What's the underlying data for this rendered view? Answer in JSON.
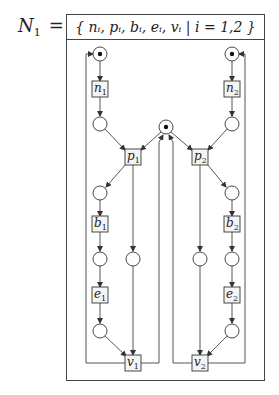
{
  "net": {
    "name": "N",
    "subscript": "1",
    "equals": "=",
    "set_definition": "{ nᵢ, pᵢ, bᵢ, eᵢ, vᵢ  |  i = 1,2 }"
  },
  "transitions": [
    {
      "id": "n1",
      "letter": "n",
      "sub": "1",
      "x": 100,
      "y": 89
    },
    {
      "id": "n2",
      "letter": "n",
      "sub": "2",
      "x": 232,
      "y": 89
    },
    {
      "id": "p1",
      "letter": "p",
      "sub": "1",
      "x": 133,
      "y": 157
    },
    {
      "id": "p2",
      "letter": "p",
      "sub": "2",
      "x": 200,
      "y": 157
    },
    {
      "id": "b1",
      "letter": "b",
      "sub": "1",
      "x": 100,
      "y": 224
    },
    {
      "id": "b2",
      "letter": "b",
      "sub": "2",
      "x": 232,
      "y": 224
    },
    {
      "id": "e1",
      "letter": "e",
      "sub": "1",
      "x": 100,
      "y": 295
    },
    {
      "id": "e2",
      "letter": "e",
      "sub": "2",
      "x": 232,
      "y": 295
    },
    {
      "id": "v1",
      "letter": "v",
      "sub": "1",
      "x": 133,
      "y": 363
    },
    {
      "id": "v2",
      "letter": "v",
      "sub": "2",
      "x": 200,
      "y": 363
    }
  ],
  "places": [
    {
      "id": "start1",
      "x": 100,
      "y": 54,
      "token": true
    },
    {
      "id": "start2",
      "x": 232,
      "y": 54,
      "token": true
    },
    {
      "id": "mutex",
      "x": 166,
      "y": 127,
      "token": true
    },
    {
      "id": "q1a",
      "x": 100,
      "y": 124,
      "token": false
    },
    {
      "id": "q2a",
      "x": 232,
      "y": 124,
      "token": false
    },
    {
      "id": "q1b",
      "x": 100,
      "y": 193,
      "token": false
    },
    {
      "id": "q2b",
      "x": 232,
      "y": 193,
      "token": false
    },
    {
      "id": "q1c",
      "x": 100,
      "y": 259,
      "token": false
    },
    {
      "id": "r1",
      "x": 133,
      "y": 259,
      "token": false
    },
    {
      "id": "r2",
      "x": 200,
      "y": 259,
      "token": false
    },
    {
      "id": "q2c",
      "x": 232,
      "y": 259,
      "token": false
    },
    {
      "id": "q1d",
      "x": 100,
      "y": 331,
      "token": false
    },
    {
      "id": "q2d",
      "x": 232,
      "y": 331,
      "token": false
    }
  ],
  "colors": {
    "stroke": "#333333",
    "box_fill": "#f4f4f4",
    "background": "#ffffff"
  }
}
